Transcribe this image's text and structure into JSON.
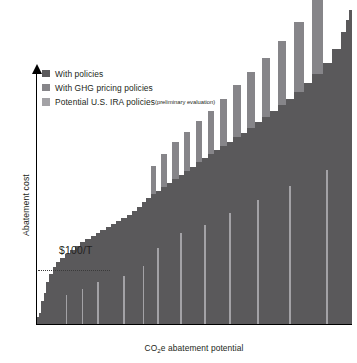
{
  "chart_data": {
    "type": "bar",
    "title": "",
    "xlabel": "CO₂e abatement potential",
    "ylabel": "Abatement cost",
    "grid": false,
    "legend_position": "top-left",
    "annotations": [
      {
        "name": "threshold",
        "label": "$100/T",
        "y_value": 100,
        "style": "dotted-horizontal-line"
      }
    ],
    "axis_notes": {
      "x_axis_arrow": false,
      "y_axis_arrow": true,
      "tick_labels": []
    },
    "series": [
      {
        "name": "With policies",
        "color": "#5a595b",
        "key": "with_policies"
      },
      {
        "name": "With GHG pricing policies",
        "color": "#868589",
        "key": "ghg_pricing"
      },
      {
        "name": "Potential U.S. IRA policies",
        "color": "#a3a2a6",
        "key": "ira_policies"
      }
    ],
    "bars": [
      {
        "x": 0.0,
        "w": 2.2,
        "base": 6,
        "ghg": 0,
        "ira": 0,
        "ira_w": 0
      },
      {
        "x": 2.2,
        "w": 2.0,
        "base": 10,
        "ghg": 0,
        "ira": 0,
        "ira_w": 0
      },
      {
        "x": 4.2,
        "w": 2.4,
        "base": 22,
        "ghg": 0,
        "ira": 0,
        "ira_w": 0
      },
      {
        "x": 6.6,
        "w": 2.2,
        "base": 30,
        "ghg": 0,
        "ira": 0,
        "ira_w": 0
      },
      {
        "x": 8.8,
        "w": 3.0,
        "base": 40,
        "ghg": 0,
        "ira": 0,
        "ira_w": 0
      },
      {
        "x": 11.8,
        "w": 3.4,
        "base": 48,
        "ghg": 0,
        "ira": 0,
        "ira_w": 0
      },
      {
        "x": 15.2,
        "w": 3.2,
        "base": 55,
        "ghg": 0,
        "ira": 0,
        "ira_w": 0
      },
      {
        "x": 18.4,
        "w": 4.0,
        "base": 60,
        "ghg": 0,
        "ira": 0,
        "ira_w": 0
      },
      {
        "x": 22.4,
        "w": 4.6,
        "base": 64,
        "ghg": 0,
        "ira": 0,
        "ira_w": 0
      },
      {
        "x": 27.0,
        "w": 5.0,
        "base": 68,
        "ghg": 0,
        "ira": 28,
        "ira_w": 1.3
      },
      {
        "x": 32.0,
        "w": 5.2,
        "base": 72,
        "ghg": 0,
        "ira": 0,
        "ira_w": 0
      },
      {
        "x": 37.2,
        "w": 5.0,
        "base": 76,
        "ghg": 0,
        "ira": 0,
        "ira_w": 0
      },
      {
        "x": 42.2,
        "w": 4.8,
        "base": 79,
        "ghg": 0,
        "ira": 34,
        "ira_w": 1.4
      },
      {
        "x": 47.0,
        "w": 5.4,
        "base": 82,
        "ghg": 0,
        "ira": 0,
        "ira_w": 0
      },
      {
        "x": 52.4,
        "w": 5.0,
        "base": 85,
        "ghg": 0,
        "ira": 0,
        "ira_w": 0
      },
      {
        "x": 57.4,
        "w": 4.6,
        "base": 88,
        "ghg": 0,
        "ira": 40,
        "ira_w": 1.5
      },
      {
        "x": 62.0,
        "w": 5.2,
        "base": 91,
        "ghg": 0,
        "ira": 0,
        "ira_w": 0
      },
      {
        "x": 67.2,
        "w": 5.0,
        "base": 94,
        "ghg": 0,
        "ira": 0,
        "ira_w": 0
      },
      {
        "x": 72.2,
        "w": 4.8,
        "base": 97,
        "ghg": 0,
        "ira": 0,
        "ira_w": 0
      },
      {
        "x": 77.0,
        "w": 5.6,
        "base": 100,
        "ghg": 0,
        "ira": 0,
        "ira_w": 0
      },
      {
        "x": 82.6,
        "w": 5.2,
        "base": 103,
        "ghg": 0,
        "ira": 46,
        "ira_w": 1.6
      },
      {
        "x": 87.8,
        "w": 5.0,
        "base": 106,
        "ghg": 0,
        "ira": 0,
        "ira_w": 0
      },
      {
        "x": 92.8,
        "w": 5.4,
        "base": 110,
        "ghg": 0,
        "ira": 0,
        "ira_w": 0
      },
      {
        "x": 98.2,
        "w": 4.0,
        "base": 114,
        "ghg": 0,
        "ira": 0,
        "ira_w": 0
      },
      {
        "x": 102.2,
        "w": 4.4,
        "base": 118,
        "ghg": 0,
        "ira": 56,
        "ira_w": 1.6
      },
      {
        "x": 106.6,
        "w": 4.8,
        "base": 122,
        "ghg": 0,
        "ira": 0,
        "ira_w": 0
      },
      {
        "x": 111.4,
        "w": 5.0,
        "base": 126,
        "ghg": 28,
        "ira": 0,
        "ira_w": 0
      },
      {
        "x": 116.4,
        "w": 4.6,
        "base": 129,
        "ghg": 0,
        "ira": 74,
        "ira_w": 1.7
      },
      {
        "x": 121.0,
        "w": 5.8,
        "base": 133,
        "ghg": 32,
        "ira": 0,
        "ira_w": 0
      },
      {
        "x": 126.8,
        "w": 5.4,
        "base": 137,
        "ghg": 0,
        "ira": 0,
        "ira_w": 0
      },
      {
        "x": 132.2,
        "w": 6.6,
        "base": 141,
        "ghg": 36,
        "ira": 0,
        "ira_w": 0
      },
      {
        "x": 138.8,
        "w": 5.0,
        "base": 145,
        "ghg": 0,
        "ira": 88,
        "ira_w": 1.8
      },
      {
        "x": 143.8,
        "w": 6.0,
        "base": 149,
        "ghg": 38,
        "ira": 0,
        "ira_w": 0
      },
      {
        "x": 149.8,
        "w": 5.4,
        "base": 153,
        "ghg": 0,
        "ira": 0,
        "ira_w": 0
      },
      {
        "x": 155.2,
        "w": 6.2,
        "base": 157,
        "ghg": 40,
        "ira": 0,
        "ira_w": 0
      },
      {
        "x": 161.4,
        "w": 5.6,
        "base": 161,
        "ghg": 0,
        "ira": 96,
        "ira_w": 1.8
      },
      {
        "x": 167.0,
        "w": 6.4,
        "base": 165,
        "ghg": 42,
        "ira": 0,
        "ira_w": 0
      },
      {
        "x": 173.4,
        "w": 5.8,
        "base": 169,
        "ghg": 0,
        "ira": 0,
        "ira_w": 0
      },
      {
        "x": 179.2,
        "w": 6.8,
        "base": 173,
        "ghg": 46,
        "ira": 0,
        "ira_w": 0
      },
      {
        "x": 186.0,
        "w": 6.0,
        "base": 177,
        "ghg": 0,
        "ira": 108,
        "ira_w": 1.9
      },
      {
        "x": 192.0,
        "w": 7.2,
        "base": 182,
        "ghg": 50,
        "ira": 0,
        "ira_w": 0
      },
      {
        "x": 199.2,
        "w": 6.4,
        "base": 186,
        "ghg": 0,
        "ira": 0,
        "ira_w": 0
      },
      {
        "x": 205.6,
        "w": 7.6,
        "base": 191,
        "ghg": 54,
        "ira": 0,
        "ira_w": 0
      },
      {
        "x": 213.2,
        "w": 6.8,
        "base": 196,
        "ghg": 0,
        "ira": 120,
        "ira_w": 2.0
      },
      {
        "x": 220.0,
        "w": 8.0,
        "base": 201,
        "ghg": 58,
        "ira": 0,
        "ira_w": 0
      },
      {
        "x": 228.0,
        "w": 7.2,
        "base": 207,
        "ghg": 0,
        "ira": 0,
        "ira_w": 0
      },
      {
        "x": 235.2,
        "w": 8.6,
        "base": 213,
        "ghg": 62,
        "ira": 0,
        "ira_w": 0
      },
      {
        "x": 243.8,
        "w": 7.6,
        "base": 219,
        "ghg": 0,
        "ira": 134,
        "ira_w": 2.1
      },
      {
        "x": 251.4,
        "w": 9.4,
        "base": 226,
        "ghg": 68,
        "ira": 0,
        "ira_w": 0
      },
      {
        "x": 260.8,
        "w": 8.2,
        "base": 234,
        "ghg": 0,
        "ira": 0,
        "ira_w": 0
      },
      {
        "x": 269.0,
        "w": 10.4,
        "base": 243,
        "ghg": 74,
        "ira": 0,
        "ira_w": 0
      },
      {
        "x": 279.4,
        "w": 9.0,
        "base": 254,
        "ghg": 0,
        "ira": 150,
        "ira_w": 2.2
      },
      {
        "x": 288.4,
        "w": 8.6,
        "base": 268,
        "ghg": 0,
        "ira": 0,
        "ira_w": 0
      },
      {
        "x": 297.0,
        "w": 5.4,
        "base": 284,
        "ghg": 0,
        "ira": 0,
        "ira_w": 0
      },
      {
        "x": 302.4,
        "w": 3.0,
        "base": 296,
        "ghg": 0,
        "ira": 0,
        "ira_w": 0
      },
      {
        "x": 305.4,
        "w": 2.6,
        "base": 306,
        "ghg": 0,
        "ira": 0,
        "ira_w": 0
      }
    ]
  },
  "legend": {
    "items": [
      {
        "label": "With policies",
        "note": "",
        "color": "#5a595b"
      },
      {
        "label": "With GHG pricing policies",
        "note": "",
        "color": "#868589"
      },
      {
        "label": "Potential U.S. IRA policies",
        "note": "(preliminary evaluation)",
        "color": "#a3a2a6"
      }
    ]
  },
  "annotation": {
    "threshold_label": "$100/T"
  },
  "axes": {
    "y_label": "Abatement cost",
    "x_label_pre": "CO",
    "x_label_sub": "2",
    "x_label_post": "e abatement potential"
  }
}
